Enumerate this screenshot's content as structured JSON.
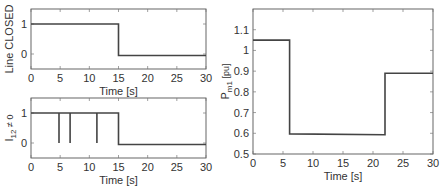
{
  "chart_data": [
    {
      "id": "line-closed",
      "type": "line",
      "title": "",
      "xlabel": "Time [s]",
      "ylabel": "Line CLOSED",
      "xlim": [
        0,
        30
      ],
      "ylim": [
        -0.5,
        1.5
      ],
      "xticks": [
        0,
        5,
        10,
        15,
        20,
        25,
        30
      ],
      "yticks": [
        0,
        1
      ],
      "grid": false,
      "series": [
        {
          "name": "Line CLOSED",
          "x": [
            0,
            15,
            15,
            30
          ],
          "y": [
            1,
            1,
            -0.05,
            -0.05
          ]
        }
      ]
    },
    {
      "id": "i12-nonzero",
      "type": "line",
      "title": "",
      "xlabel": "Time [s]",
      "ylabel": "I12 ≠ 0",
      "ylabel_main": "I",
      "ylabel_sub": "12",
      "ylabel_rest": " ≠ 0",
      "xlim": [
        0,
        30
      ],
      "ylim": [
        -0.5,
        1.5
      ],
      "xticks": [
        0,
        5,
        10,
        15,
        20,
        25,
        30
      ],
      "yticks": [
        0,
        1
      ],
      "grid": false,
      "series": [
        {
          "name": "I12 ≠ 0",
          "x": [
            0,
            4.8,
            4.8,
            4.8,
            6.7,
            6.7,
            6.7,
            11.3,
            11.3,
            11.3,
            15,
            15,
            30
          ],
          "y": [
            1,
            1,
            0,
            1,
            1,
            0,
            1,
            1,
            0,
            1,
            1,
            -0.05,
            -0.05
          ]
        }
      ]
    },
    {
      "id": "pm1",
      "type": "line",
      "title": "",
      "xlabel": "Time [s]",
      "ylabel": "Pm1 [pu]",
      "ylabel_main": "P",
      "ylabel_sub": "m1",
      "ylabel_rest": "  [pu]",
      "xlim": [
        0,
        30
      ],
      "ylim": [
        0.5,
        1.2
      ],
      "xticks": [
        0,
        5,
        10,
        15,
        20,
        25,
        30
      ],
      "yticks": [
        0.5,
        0.6,
        0.7,
        0.8,
        0.9,
        1,
        1.1
      ],
      "grid": false,
      "series": [
        {
          "name": "Pm1",
          "x": [
            0,
            6.1,
            6.1,
            22,
            22,
            30
          ],
          "y": [
            1.05,
            1.05,
            0.597,
            0.593,
            0.89,
            0.89
          ]
        }
      ]
    }
  ]
}
